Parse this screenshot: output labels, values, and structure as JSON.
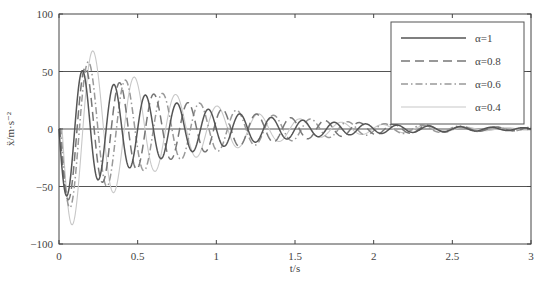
{
  "chart_data": {
    "type": "line",
    "title": "",
    "xlabel": "t/s",
    "ylabel": "ẍ/m·s⁻²",
    "xlim": [
      0,
      3
    ],
    "ylim": [
      -100,
      100
    ],
    "xticks": [
      0,
      0.5,
      1,
      1.5,
      2,
      2.5,
      3
    ],
    "xtick_labels": [
      "0",
      "0.5",
      "1",
      "1.5",
      "2",
      "2.5",
      "3"
    ],
    "yticks": [
      -100,
      -50,
      0,
      50,
      100
    ],
    "ytick_labels": [
      "−100",
      "−50",
      "0",
      "50",
      "100"
    ],
    "grid": {
      "horizontal": [
        50,
        0,
        -50
      ],
      "vertical": false
    },
    "legend": {
      "position": "upper right",
      "entries": [
        "α=1",
        "α=0.8",
        "α=0.6",
        "α=0.4"
      ]
    },
    "note": "Curve shapes below are approximate parametric fits (damped sinusoids) estimated from the visible peaks; not sampled data from the source figure.",
    "series": [
      {
        "name": "α=1",
        "style": "solid",
        "color": "#555555",
        "observed_features": {
          "first_trough": [
            0.06,
            -60
          ],
          "first_peak": [
            0.15,
            52
          ],
          "amp_at_t1.2": 12
        },
        "approx_model": {
          "amp": 62,
          "decay": 1.35,
          "freq_hz": 5.0,
          "phase_shift": 0.0
        }
      },
      {
        "name": "α=0.8",
        "style": "dashed",
        "color": "#777777",
        "observed_features": {
          "first_trough": [
            0.07,
            -65
          ],
          "first_peak": [
            0.16,
            52
          ]
        },
        "approx_model": {
          "amp": 66,
          "decay": 1.3,
          "freq_hz": 4.6,
          "phase_shift": 0.006
        }
      },
      {
        "name": "α=0.6",
        "style": "dash-dot",
        "color": "#999999",
        "observed_features": {
          "first_trough": [
            0.08,
            -75
          ],
          "first_peak": [
            0.17,
            51
          ]
        },
        "approx_model": {
          "amp": 74,
          "decay": 1.35,
          "freq_hz": 4.25,
          "phase_shift": 0.012
        }
      },
      {
        "name": "α=0.4",
        "style": "solid-thin-light",
        "color": "#c8c8c8",
        "observed_features": {
          "first_trough": [
            0.1,
            -92
          ],
          "first_peak": [
            0.2,
            50
          ]
        },
        "approx_model": {
          "amp": 92,
          "decay": 1.55,
          "freq_hz": 3.8,
          "phase_shift": 0.02
        }
      }
    ]
  }
}
